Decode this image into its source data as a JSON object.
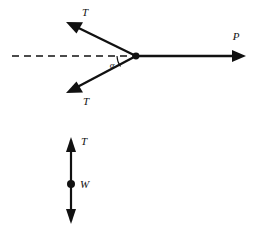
{
  "figure": {
    "background_color": "#ffffff",
    "stroke_color": "#111111",
    "title": "",
    "diagrams": [
      {
        "name": "cable-junction-force-diagram",
        "description": "Two cable tensions T meeting a horizontal force P at a common point, each inclined at angle alpha to the horizontal reference line",
        "vertex": {
          "x": 136,
          "y": 56
        },
        "reference_line": {
          "style": "dashed",
          "from": {
            "x": 12,
            "y": 56
          },
          "to": {
            "x": 136,
            "y": 56
          }
        },
        "angle": {
          "symbol": "α",
          "label_x": 112,
          "label_y": 68
        },
        "vectors": [
          {
            "label": "T",
            "direction": "up-left",
            "tail": {
              "x": 136,
              "y": 56
            },
            "tip": {
              "x": 66,
              "y": 22
            },
            "label_x": 85,
            "label_y": 16
          },
          {
            "label": "T",
            "direction": "down-left",
            "tail": {
              "x": 136,
              "y": 56
            },
            "tip": {
              "x": 66,
              "y": 93
            },
            "label_x": 86,
            "label_y": 105
          },
          {
            "label": "P",
            "direction": "right",
            "tail": {
              "x": 136,
              "y": 56
            },
            "tip": {
              "x": 246,
              "y": 56
            },
            "label_x": 236,
            "label_y": 40
          }
        ]
      },
      {
        "name": "weight-equilibrium-diagram",
        "description": "Vertical member with upward tension T at top and downward weight W reaction at bottom, with particle dot marked W",
        "axis_x": 71,
        "top_y": 137,
        "bottom_y": 224,
        "node": {
          "label": "W",
          "x": 71,
          "y": 184,
          "radius": 4,
          "label_x": 80,
          "label_y": 188
        },
        "vectors": [
          {
            "label": "T",
            "direction": "up",
            "tail": {
              "x": 71,
              "y": 184
            },
            "tip": {
              "x": 71,
              "y": 137
            },
            "label_x": 81,
            "label_y": 145
          },
          {
            "label": "",
            "direction": "down",
            "tail": {
              "x": 71,
              "y": 184
            },
            "tip": {
              "x": 71,
              "y": 224
            },
            "label_x": 0,
            "label_y": 0
          }
        ]
      }
    ]
  }
}
